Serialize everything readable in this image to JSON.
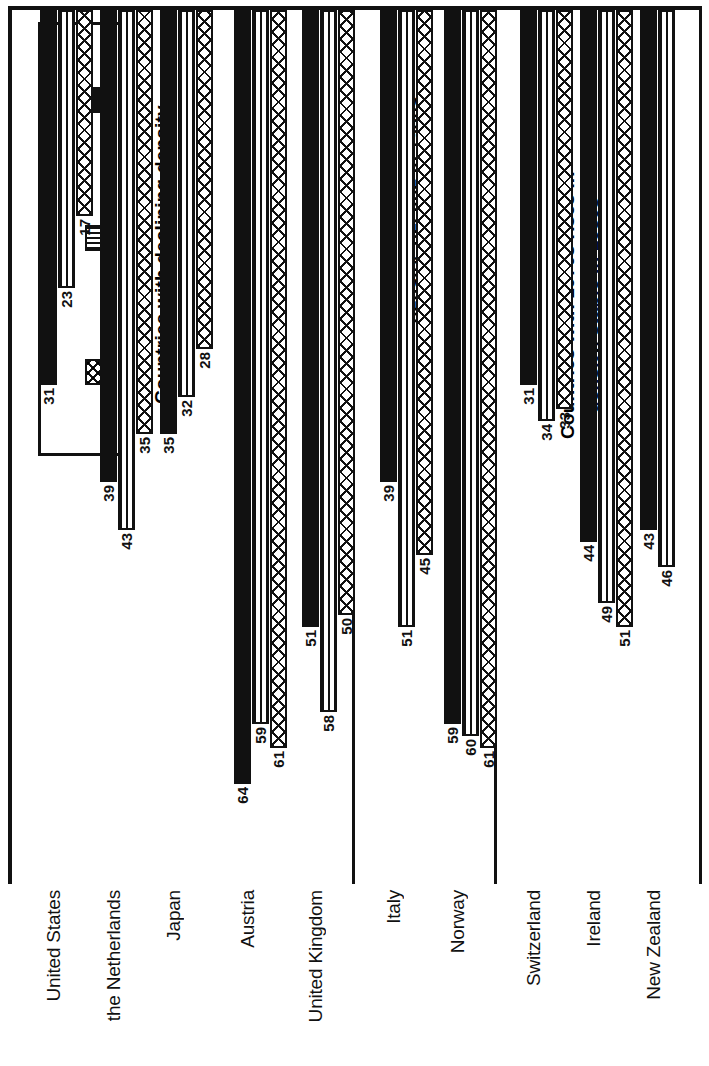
{
  "legend": {
    "items": [
      {
        "label": "1970",
        "pattern": "solid-black"
      },
      {
        "label": "1979",
        "pattern": "horizontal-lines"
      },
      {
        "label": "1986/87",
        "pattern": "cross-hatch"
      }
    ]
  },
  "panels": [
    {
      "title": "Countries with declining density"
    },
    {
      "title": "Countries with 1970s rises in\ndensity, decline in 1980s"
    },
    {
      "title": "Countries with 1970s rises in\ndensity,  stable in 1980s"
    }
  ],
  "chart_data": {
    "type": "bar",
    "title": "",
    "xlabel": "",
    "ylabel": "",
    "ylim": [
      0,
      70
    ],
    "grid": false,
    "legend_position": "top-left",
    "orientation": "rotated-90",
    "series": [
      {
        "name": "1970",
        "pattern": "solid-black",
        "values": [
          31,
          39,
          35,
          64,
          51,
          39,
          59,
          31,
          44,
          43
        ]
      },
      {
        "name": "1979",
        "pattern": "horizontal-lines",
        "values": [
          23,
          43,
          32,
          59,
          58,
          51,
          60,
          34,
          49,
          46
        ]
      },
      {
        "name": "1986/87",
        "pattern": "cross-hatch",
        "values": [
          17,
          35,
          28,
          61,
          50,
          45,
          61,
          33,
          51,
          null
        ]
      }
    ],
    "categories": [
      "United States",
      "the Netherlands",
      "Japan",
      "Austria",
      "United Kingdom",
      "Italy",
      "Norway",
      "Switzerland",
      "Ireland",
      "New Zealand"
    ],
    "groups": [
      {
        "panel": "Countries with declining density",
        "categories": [
          "United States",
          "the Netherlands",
          "Japan",
          "Austria",
          "United Kingdom"
        ]
      },
      {
        "panel": "Countries with 1970s rises in density, decline in 1980s",
        "categories": [
          "Italy",
          "Norway"
        ]
      },
      {
        "panel": "Countries with 1970s rises in density,  stable in 1980s",
        "categories": [
          "Switzerland",
          "Ireland",
          "New Zealand"
        ]
      }
    ]
  }
}
